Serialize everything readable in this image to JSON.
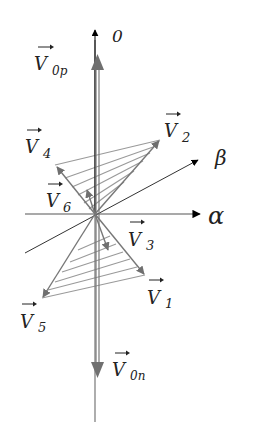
{
  "diagram": {
    "title": "",
    "axes": {
      "zero": {
        "label": "0"
      },
      "alpha": {
        "label": "α"
      },
      "beta": {
        "label": "β"
      }
    },
    "vectors": [
      {
        "id": "V0p",
        "main": "V",
        "sub": "0p"
      },
      {
        "id": "V0n",
        "main": "V",
        "sub": "0n"
      },
      {
        "id": "V1",
        "main": "V",
        "sub": "1"
      },
      {
        "id": "V2",
        "main": "V",
        "sub": "2"
      },
      {
        "id": "V3",
        "main": "V",
        "sub": "3"
      },
      {
        "id": "V4",
        "main": "V",
        "sub": "4"
      },
      {
        "id": "V5",
        "main": "V",
        "sub": "5"
      },
      {
        "id": "V6",
        "main": "V",
        "sub": "6"
      }
    ],
    "colors": {
      "axis": "#000000",
      "vector": "#777777",
      "hatch": "#999999",
      "text": "#222222"
    }
  }
}
